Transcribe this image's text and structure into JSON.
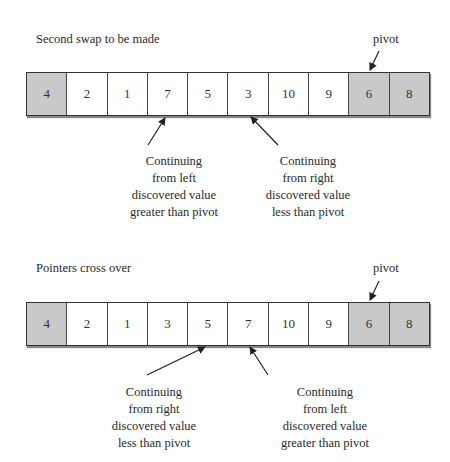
{
  "panels": [
    {
      "title": "Second swap to be made",
      "pivot_label": "pivot",
      "cells": [
        {
          "value": "4",
          "shaded": true
        },
        {
          "value": "2",
          "shaded": false
        },
        {
          "value": "1",
          "shaded": false
        },
        {
          "value": "7",
          "shaded": false
        },
        {
          "value": "5",
          "shaded": false
        },
        {
          "value": "3",
          "shaded": false
        },
        {
          "value": "10",
          "shaded": false
        },
        {
          "value": "9",
          "shaded": false
        },
        {
          "value": "6",
          "shaded": true
        },
        {
          "value": "8",
          "shaded": true
        }
      ],
      "captions": [
        {
          "lines": [
            "Continuing",
            "from left",
            "discovered value",
            "greater than pivot"
          ],
          "points_to_index": 3
        },
        {
          "lines": [
            "Continuing",
            "from right",
            "discovered value",
            "less than pivot"
          ],
          "points_to_index": 5
        }
      ]
    },
    {
      "title": "Pointers cross over",
      "pivot_label": "pivot",
      "cells": [
        {
          "value": "4",
          "shaded": true
        },
        {
          "value": "2",
          "shaded": false
        },
        {
          "value": "1",
          "shaded": false
        },
        {
          "value": "3",
          "shaded": false
        },
        {
          "value": "5",
          "shaded": false
        },
        {
          "value": "7",
          "shaded": false
        },
        {
          "value": "10",
          "shaded": false
        },
        {
          "value": "9",
          "shaded": false
        },
        {
          "value": "6",
          "shaded": true
        },
        {
          "value": "8",
          "shaded": true
        }
      ],
      "captions": [
        {
          "lines": [
            "Continuing",
            "from right",
            "discovered value",
            "less than pivot"
          ],
          "points_to_index": 4
        },
        {
          "lines": [
            "Continuing",
            "from left",
            "discovered value",
            "greater than pivot"
          ],
          "points_to_index": 5
        }
      ]
    }
  ]
}
